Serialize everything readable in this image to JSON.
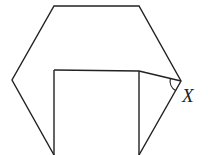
{
  "diagram": {
    "type": "geometry",
    "line_color": "#222222",
    "background": "#ffffff",
    "vertices": {
      "hex_top_left": [
        54,
        6
      ],
      "hex_top_right": [
        139,
        6
      ],
      "hex_right": [
        181,
        81
      ],
      "hex_bottom_right": [
        139,
        155
      ],
      "hex_bottom_left": [
        54,
        155
      ],
      "hex_left": [
        12,
        80
      ],
      "square_top_left": [
        54,
        70
      ],
      "square_top_right": [
        139,
        71
      ]
    },
    "angle_label": "X",
    "angle_at": "hex_right"
  }
}
